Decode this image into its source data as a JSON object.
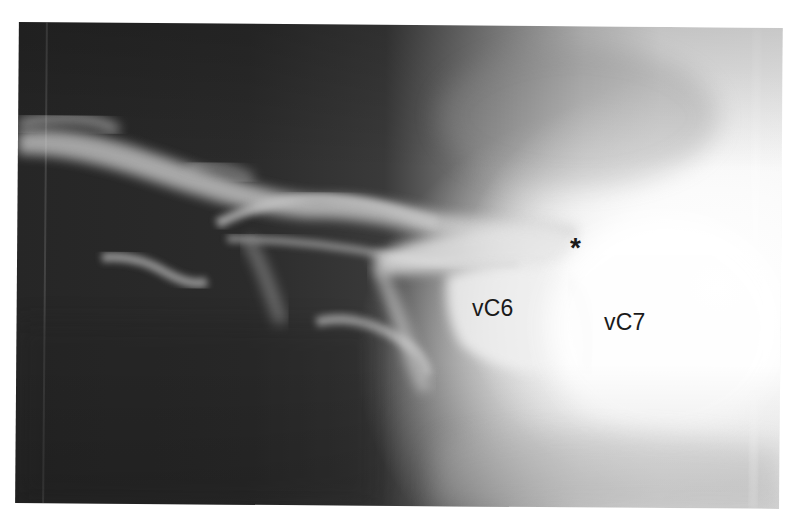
{
  "image": {
    "type": "lateral cervical spine radiograph",
    "tone": "grayscale",
    "colors": {
      "dark_background": "#2a2a2a",
      "bright_region": "#f6f6f6",
      "label_text": "#1a1a1a",
      "page_background": "#ffffff"
    }
  },
  "annotations": {
    "marker": "*",
    "vertebra_c6": "vC6",
    "vertebra_c7": "vC7"
  }
}
